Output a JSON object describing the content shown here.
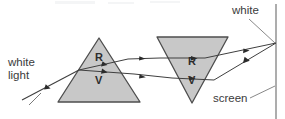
{
  "figure": {
    "type": "optics-ray-diagram",
    "title": "",
    "background_color": "#ffffff",
    "width": 285,
    "height": 119
  },
  "labels": {
    "white_light": "white\nlight",
    "white_light_line1": "white",
    "white_light_line2": "light",
    "white": "white",
    "screen": "screen"
  },
  "prisms": [
    {
      "name": "prism-one",
      "orientation": "apex-up",
      "fill_color": "#c8c8c8",
      "stroke_color": "#4d4d4d",
      "vertices": [
        [
          99,
          38
        ],
        [
          58,
          102
        ],
        [
          140,
          102
        ]
      ],
      "labels": {
        "red": "R",
        "violet": "V"
      }
    },
    {
      "name": "prism-two",
      "orientation": "apex-down",
      "fill_color": "#c8c8c8",
      "stroke_color": "#4d4d4d",
      "vertices": [
        [
          157,
          37
        ],
        [
          228,
          37
        ],
        [
          192,
          103
        ]
      ],
      "labels": {
        "red": "R",
        "violet": "V"
      }
    }
  ],
  "screen": {
    "label": "screen",
    "orientation": "vertical",
    "x": 276,
    "y_top": 4,
    "y_bottom": 119,
    "color": "#8a8a8a"
  },
  "rays": {
    "incident": {
      "name": "white-light-incident-ray",
      "color": "#3f3f3f",
      "from": [
        24,
        99
      ],
      "to": [
        79,
        70
      ],
      "arrow_at": [
        47,
        87
      ]
    },
    "red": {
      "name": "red-ray",
      "color": "#3f3f3f",
      "points": [
        [
          79,
          70
        ],
        [
          119,
          63
        ],
        [
          162,
          57
        ],
        [
          203,
          63
        ],
        [
          276,
          43
        ]
      ]
    },
    "violet": {
      "name": "violet-ray",
      "color": "#3f3f3f",
      "points": [
        [
          79,
          70
        ],
        [
          119,
          72
        ],
        [
          162,
          77
        ],
        [
          210,
          80
        ],
        [
          276,
          43
        ]
      ]
    },
    "recombined": {
      "name": "recombined-white-ray",
      "color": "#3f3f3f",
      "converge_point": [
        276,
        43
      ]
    }
  },
  "leaders": {
    "white_leader": {
      "from": [
        253,
        18
      ],
      "to": [
        276,
        43
      ]
    },
    "screen_leader": {
      "from": [
        248,
        97
      ],
      "to": [
        272,
        86
      ]
    },
    "light_leader": {
      "from": [
        31,
        103
      ],
      "to": [
        44,
        91
      ]
    }
  },
  "colors": {
    "prism_fill": "#c8c8c8",
    "prism_stroke": "#4d4d4d",
    "ray": "#3f3f3f",
    "text": "#3b3b3b",
    "screen": "#8a8a8a"
  }
}
